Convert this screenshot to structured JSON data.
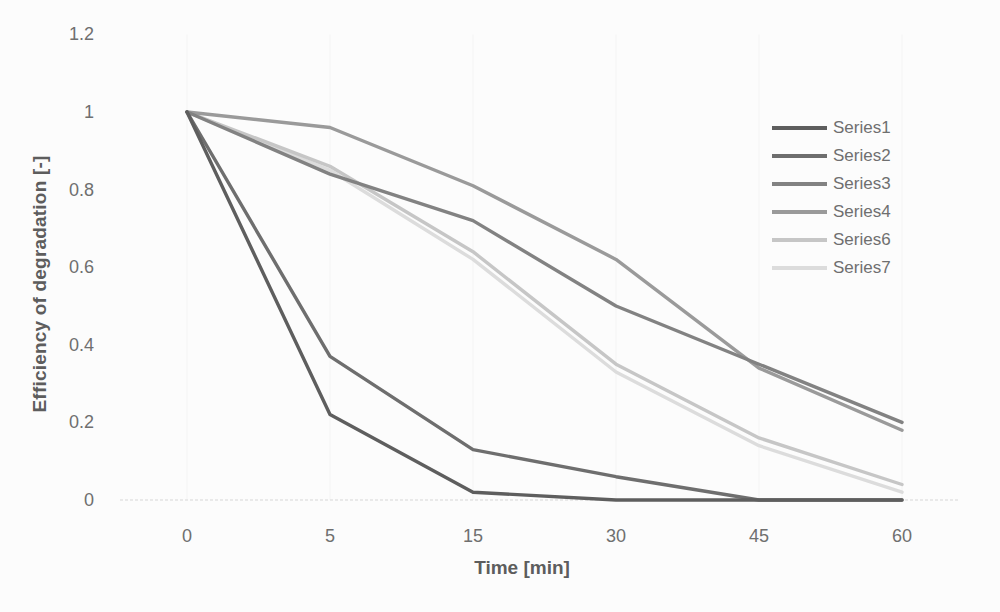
{
  "chart_data": {
    "type": "line",
    "title": "",
    "xlabel": "Time [min]",
    "ylabel": "Efficiency of degradation [-]",
    "x_categories": [
      "0",
      "5",
      "15",
      "30",
      "45",
      "60"
    ],
    "y_ticks": [
      "0",
      "0.2",
      "0.4",
      "0.6",
      "0.8",
      "1",
      "1.2"
    ],
    "ylim": [
      0,
      1.2
    ],
    "x_axis_type": "category",
    "grid": "faint vertical gridlines at each x category, dotted baseline at y=0",
    "legend_position": "right",
    "background_color": "#fcfcfc",
    "axis_text_color": "#6f6f6f",
    "axis_title_color": "#5d5d5d",
    "series": [
      {
        "name": "Series1",
        "color": "#5e5e5e",
        "values": [
          1,
          0.22,
          0.02,
          0,
          0,
          0
        ]
      },
      {
        "name": "Series2",
        "color": "#6e6e6e",
        "values": [
          1,
          0.37,
          0.13,
          0.06,
          0,
          0
        ]
      },
      {
        "name": "Series3",
        "color": "#828282",
        "values": [
          1,
          0.84,
          0.72,
          0.5,
          0.35,
          0.2
        ]
      },
      {
        "name": "Series4",
        "color": "#9a9a9a",
        "values": [
          1,
          0.96,
          0.81,
          0.62,
          0.34,
          0.18
        ]
      },
      {
        "name": "Series6",
        "color": "#c6c6c6",
        "values": [
          1,
          0.86,
          0.64,
          0.35,
          0.16,
          0.04
        ]
      },
      {
        "name": "Series7",
        "color": "#dcdcdc",
        "values": [
          1,
          0.85,
          0.62,
          0.33,
          0.14,
          0.02
        ]
      }
    ]
  }
}
